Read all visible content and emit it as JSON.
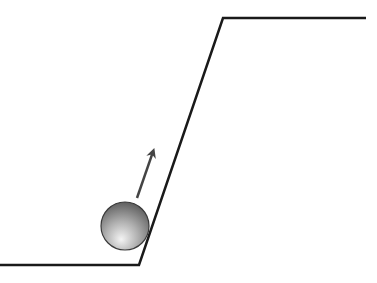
{
  "diagram": {
    "colors": {
      "background": "#ffffff",
      "line": "#1a1a1a",
      "arrow": "#444444",
      "ball_light": "#f2f2f2",
      "ball_dark": "#5a5a5a",
      "ball_edge": "#3a3a3a"
    },
    "surface": {
      "points": [
        [
          0,
          265
        ],
        [
          139,
          265
        ],
        [
          223,
          18
        ],
        [
          366,
          18
        ]
      ],
      "stroke_width": 2.5
    },
    "ball": {
      "cx": 125,
      "cy": 226,
      "r": 24
    },
    "arrow": {
      "x1": 137,
      "y1": 198,
      "x2": 155,
      "y2": 146,
      "stroke_width": 2.5
    }
  }
}
